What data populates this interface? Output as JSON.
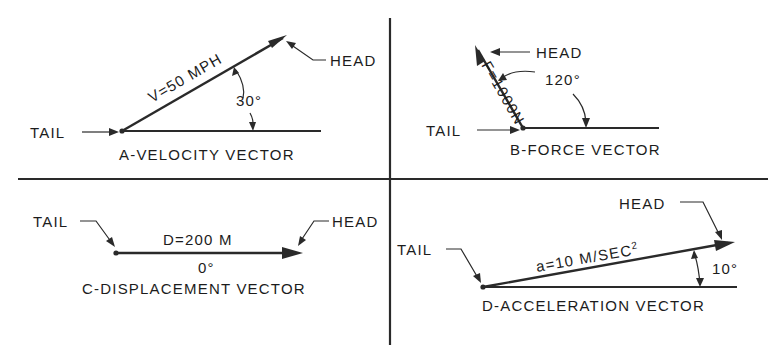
{
  "diagram": {
    "colors": {
      "ink": "#2a2a2a",
      "background": "#ffffff"
    },
    "panels": [
      {
        "id": "A",
        "caption": "A-VELOCITY VECTOR",
        "vector_label": "V=50 MPH",
        "angle_label": "30°",
        "angle_deg": 30,
        "tail_label": "TAIL",
        "head_label": "HEAD"
      },
      {
        "id": "B",
        "caption": "B-FORCE VECTOR",
        "vector_label": "F=1000N",
        "angle_label": "120°",
        "angle_deg": 120,
        "tail_label": "TAIL",
        "head_label": "HEAD"
      },
      {
        "id": "C",
        "caption": "C-DISPLACEMENT VECTOR",
        "vector_label": "D=200 M",
        "angle_label": "0°",
        "angle_deg": 0,
        "tail_label": "TAIL",
        "head_label": "HEAD"
      },
      {
        "id": "D",
        "caption": "D-ACCELERATION VECTOR",
        "vector_label_prefix": "a=10 M/SEC",
        "vector_label_superscript": "2",
        "angle_label": "10°",
        "angle_deg": 10,
        "tail_label": "TAIL",
        "head_label": "HEAD"
      }
    ]
  }
}
